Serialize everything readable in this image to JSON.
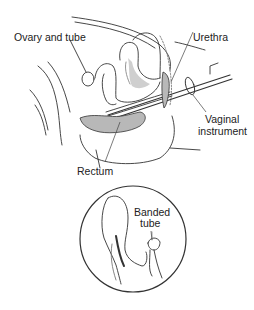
{
  "diagram": {
    "type": "anatomical-illustration",
    "labels": {
      "ovary_and_tube": "Ovary and tube",
      "urethra": "Urethra",
      "vaginal_instrument_line1": "Vaginal",
      "vaginal_instrument_line2": "instrument",
      "rectum": "Rectum",
      "banded_tube_line1": "Banded",
      "banded_tube_line2": "tube"
    },
    "colors": {
      "line": "#333333",
      "shading": "#b8b8b8",
      "background": "#ffffff"
    }
  }
}
